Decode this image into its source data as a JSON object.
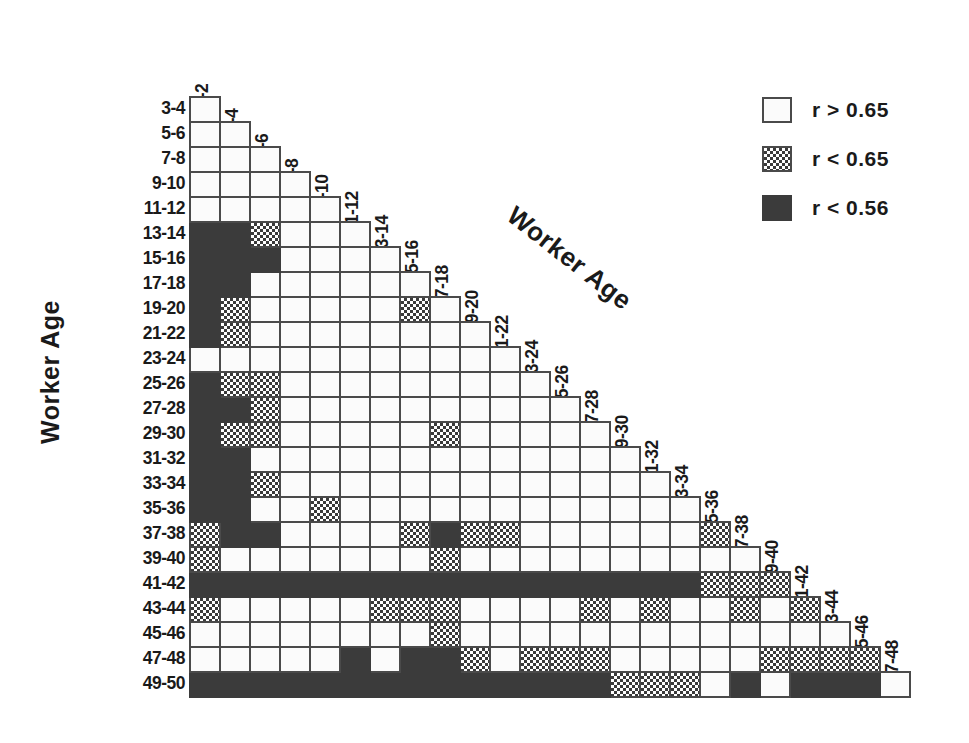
{
  "figure": {
    "y_axis_title": "Worker Age",
    "x_axis_title": "Worker Age"
  },
  "legend": {
    "items": [
      {
        "fill": "white",
        "label": "r > 0.65"
      },
      {
        "fill": "hatch",
        "label": "r < 0.65"
      },
      {
        "fill": "solid",
        "label": "r < 0.56"
      }
    ]
  },
  "chart_data": {
    "type": "heatmap",
    "title": "",
    "xlabel": "Worker Age",
    "ylabel": "Worker Age",
    "grid": true,
    "legend_position": "top-right",
    "shape": "lower-triangular",
    "categories_note": "Cell value categories: white = r > 0.65, hatch = r < 0.65, solid = r < 0.56, empty = no cell",
    "value_levels": {
      "white": "r > 0.65",
      "hatch": "r < 0.65",
      "solid": "r < 0.56",
      "empty": "not plotted"
    },
    "columns": [
      "1-2",
      "3-4",
      "5-6",
      "7-8",
      "9-10",
      "11-12",
      "13-14",
      "15-16",
      "17-18",
      "19-20",
      "21-22",
      "23-24",
      "25-26",
      "27-28",
      "29-30",
      "31-32",
      "33-34",
      "35-36",
      "37-38",
      "39-40",
      "41-42",
      "43-44",
      "45-46",
      "47-48"
    ],
    "rows": [
      "3-4",
      "5-6",
      "7-8",
      "9-10",
      "11-12",
      "13-14",
      "15-16",
      "17-18",
      "19-20",
      "21-22",
      "23-24",
      "25-26",
      "27-28",
      "29-30",
      "31-32",
      "33-34",
      "35-36",
      "37-38",
      "39-40",
      "41-42",
      "43-44",
      "45-46",
      "47-48",
      "49-50"
    ],
    "cells": [
      [
        "white",
        "empty",
        "empty",
        "empty",
        "empty",
        "empty",
        "empty",
        "empty",
        "empty",
        "empty",
        "empty",
        "empty",
        "empty",
        "empty",
        "empty",
        "empty",
        "empty",
        "empty",
        "empty",
        "empty",
        "empty",
        "empty",
        "empty",
        "empty"
      ],
      [
        "white",
        "white",
        "empty",
        "empty",
        "empty",
        "empty",
        "empty",
        "empty",
        "empty",
        "empty",
        "empty",
        "empty",
        "empty",
        "empty",
        "empty",
        "empty",
        "empty",
        "empty",
        "empty",
        "empty",
        "empty",
        "empty",
        "empty",
        "empty"
      ],
      [
        "white",
        "white",
        "white",
        "empty",
        "empty",
        "empty",
        "empty",
        "empty",
        "empty",
        "empty",
        "empty",
        "empty",
        "empty",
        "empty",
        "empty",
        "empty",
        "empty",
        "empty",
        "empty",
        "empty",
        "empty",
        "empty",
        "empty",
        "empty"
      ],
      [
        "white",
        "white",
        "white",
        "white",
        "empty",
        "empty",
        "empty",
        "empty",
        "empty",
        "empty",
        "empty",
        "empty",
        "empty",
        "empty",
        "empty",
        "empty",
        "empty",
        "empty",
        "empty",
        "empty",
        "empty",
        "empty",
        "empty",
        "empty"
      ],
      [
        "white",
        "white",
        "white",
        "white",
        "white",
        "empty",
        "empty",
        "empty",
        "empty",
        "empty",
        "empty",
        "empty",
        "empty",
        "empty",
        "empty",
        "empty",
        "empty",
        "empty",
        "empty",
        "empty",
        "empty",
        "empty",
        "empty",
        "empty"
      ],
      [
        "solid",
        "solid",
        "hatch",
        "white",
        "white",
        "white",
        "empty",
        "empty",
        "empty",
        "empty",
        "empty",
        "empty",
        "empty",
        "empty",
        "empty",
        "empty",
        "empty",
        "empty",
        "empty",
        "empty",
        "empty",
        "empty",
        "empty",
        "empty"
      ],
      [
        "solid",
        "solid",
        "solid",
        "white",
        "white",
        "white",
        "white",
        "empty",
        "empty",
        "empty",
        "empty",
        "empty",
        "empty",
        "empty",
        "empty",
        "empty",
        "empty",
        "empty",
        "empty",
        "empty",
        "empty",
        "empty",
        "empty",
        "empty"
      ],
      [
        "solid",
        "solid",
        "white",
        "white",
        "white",
        "white",
        "white",
        "white",
        "empty",
        "empty",
        "empty",
        "empty",
        "empty",
        "empty",
        "empty",
        "empty",
        "empty",
        "empty",
        "empty",
        "empty",
        "empty",
        "empty",
        "empty",
        "empty"
      ],
      [
        "solid",
        "hatch",
        "white",
        "white",
        "white",
        "white",
        "white",
        "hatch",
        "white",
        "empty",
        "empty",
        "empty",
        "empty",
        "empty",
        "empty",
        "empty",
        "empty",
        "empty",
        "empty",
        "empty",
        "empty",
        "empty",
        "empty",
        "empty"
      ],
      [
        "solid",
        "hatch",
        "white",
        "white",
        "white",
        "white",
        "white",
        "white",
        "white",
        "white",
        "empty",
        "empty",
        "empty",
        "empty",
        "empty",
        "empty",
        "empty",
        "empty",
        "empty",
        "empty",
        "empty",
        "empty",
        "empty",
        "empty"
      ],
      [
        "white",
        "white",
        "white",
        "white",
        "white",
        "white",
        "white",
        "white",
        "white",
        "white",
        "white",
        "empty",
        "empty",
        "empty",
        "empty",
        "empty",
        "empty",
        "empty",
        "empty",
        "empty",
        "empty",
        "empty",
        "empty",
        "empty"
      ],
      [
        "solid",
        "hatch",
        "hatch",
        "white",
        "white",
        "white",
        "white",
        "white",
        "white",
        "white",
        "white",
        "white",
        "empty",
        "empty",
        "empty",
        "empty",
        "empty",
        "empty",
        "empty",
        "empty",
        "empty",
        "empty",
        "empty",
        "empty"
      ],
      [
        "solid",
        "solid",
        "hatch",
        "white",
        "white",
        "white",
        "white",
        "white",
        "white",
        "white",
        "white",
        "white",
        "white",
        "empty",
        "empty",
        "empty",
        "empty",
        "empty",
        "empty",
        "empty",
        "empty",
        "empty",
        "empty",
        "empty"
      ],
      [
        "solid",
        "hatch",
        "hatch",
        "white",
        "white",
        "white",
        "white",
        "white",
        "hatch",
        "white",
        "white",
        "white",
        "white",
        "white",
        "empty",
        "empty",
        "empty",
        "empty",
        "empty",
        "empty",
        "empty",
        "empty",
        "empty",
        "empty"
      ],
      [
        "solid",
        "solid",
        "white",
        "white",
        "white",
        "white",
        "white",
        "white",
        "white",
        "white",
        "white",
        "white",
        "white",
        "white",
        "white",
        "empty",
        "empty",
        "empty",
        "empty",
        "empty",
        "empty",
        "empty",
        "empty",
        "empty"
      ],
      [
        "solid",
        "solid",
        "hatch",
        "white",
        "white",
        "white",
        "white",
        "white",
        "white",
        "white",
        "white",
        "white",
        "white",
        "white",
        "white",
        "white",
        "empty",
        "empty",
        "empty",
        "empty",
        "empty",
        "empty",
        "empty",
        "empty"
      ],
      [
        "solid",
        "solid",
        "white",
        "white",
        "hatch",
        "white",
        "white",
        "white",
        "white",
        "white",
        "white",
        "white",
        "white",
        "white",
        "white",
        "white",
        "white",
        "empty",
        "empty",
        "empty",
        "empty",
        "empty",
        "empty",
        "empty"
      ],
      [
        "hatch",
        "solid",
        "solid",
        "white",
        "white",
        "white",
        "white",
        "hatch",
        "solid",
        "hatch",
        "hatch",
        "white",
        "white",
        "white",
        "white",
        "white",
        "white",
        "hatch",
        "empty",
        "empty",
        "empty",
        "empty",
        "empty",
        "empty"
      ],
      [
        "hatch",
        "white",
        "white",
        "white",
        "white",
        "white",
        "white",
        "white",
        "hatch",
        "white",
        "white",
        "white",
        "white",
        "white",
        "white",
        "white",
        "white",
        "white",
        "white",
        "empty",
        "empty",
        "empty",
        "empty",
        "empty"
      ],
      [
        "solid",
        "solid",
        "solid",
        "solid",
        "solid",
        "solid",
        "solid",
        "solid",
        "solid",
        "solid",
        "solid",
        "solid",
        "solid",
        "solid",
        "solid",
        "solid",
        "solid",
        "hatch",
        "hatch",
        "hatch",
        "empty",
        "empty",
        "empty",
        "empty"
      ],
      [
        "hatch",
        "white",
        "white",
        "white",
        "white",
        "white",
        "hatch",
        "hatch",
        "hatch",
        "white",
        "white",
        "white",
        "white",
        "hatch",
        "white",
        "hatch",
        "white",
        "white",
        "hatch",
        "white",
        "hatch",
        "empty",
        "empty",
        "empty"
      ],
      [
        "white",
        "white",
        "white",
        "white",
        "white",
        "white",
        "white",
        "white",
        "hatch",
        "white",
        "white",
        "white",
        "white",
        "white",
        "white",
        "white",
        "white",
        "white",
        "white",
        "white",
        "white",
        "white",
        "empty",
        "empty"
      ],
      [
        "white",
        "white",
        "white",
        "white",
        "white",
        "solid",
        "white",
        "solid",
        "solid",
        "hatch",
        "white",
        "hatch",
        "hatch",
        "hatch",
        "white",
        "white",
        "white",
        "white",
        "white",
        "hatch",
        "hatch",
        "hatch",
        "hatch",
        "empty"
      ],
      [
        "solid",
        "solid",
        "solid",
        "solid",
        "solid",
        "solid",
        "solid",
        "solid",
        "solid",
        "solid",
        "solid",
        "solid",
        "solid",
        "solid",
        "hatch",
        "hatch",
        "hatch",
        "white",
        "solid",
        "white",
        "solid",
        "solid",
        "solid",
        "white"
      ]
    ]
  }
}
